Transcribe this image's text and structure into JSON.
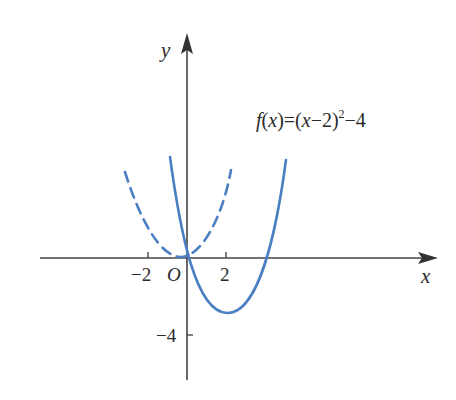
{
  "diagram": {
    "type": "function-graph",
    "formula": {
      "f": "f",
      "arg": "(x)",
      "eq": "=(",
      "x": "x",
      "minus2": "−2)",
      "exp": "2",
      "tail": "−4"
    },
    "axes": {
      "x_label": "x",
      "y_label": "y",
      "origin_label": "O"
    },
    "ticks": {
      "x_neg2": "−2",
      "x_pos2": "2",
      "y_neg4": "−4"
    },
    "colors": {
      "curve": "#4a7fc1",
      "axis": "#454545",
      "text": "#2a2a2a"
    },
    "curves": [
      {
        "name": "f(x)=(x-2)^2-4",
        "style": "solid",
        "vertex": [
          2,
          -4
        ],
        "x_intercepts": [
          0,
          4
        ]
      },
      {
        "name": "reflected/auxiliary parabola",
        "style": "dashed",
        "vertex": [
          0,
          0
        ]
      }
    ]
  }
}
